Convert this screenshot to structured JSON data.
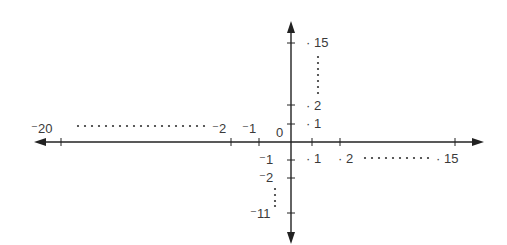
{
  "diagram": {
    "type": "coordinate-axes-number-lines",
    "origin_label": "0",
    "x_axis": {
      "negative_labels": [
        "⁻20",
        "⁻2",
        "⁻1"
      ],
      "positive_labels": [
        "· 1",
        "· 2",
        "· 15"
      ]
    },
    "y_axis": {
      "positive_labels": [
        "· 1",
        "· 2",
        "· 15"
      ],
      "negative_labels": [
        "⁻1",
        "⁻2",
        "⁻11"
      ]
    },
    "labels": {
      "origin": "0",
      "xneg20": "⁻20",
      "xneg2": "⁻2",
      "xneg1": "⁻1",
      "xpos1": "· 1",
      "xpos2": "· 2",
      "xpos15": "· 15",
      "ypos1": "· 1",
      "ypos2": "· 2",
      "ypos15": "· 15",
      "yneg1": "⁻1",
      "yneg2": "⁻2",
      "yneg11": "⁻11"
    },
    "colors": {
      "ink": "#222222",
      "text": "#3a3a3a",
      "background": "#ffffff"
    }
  }
}
